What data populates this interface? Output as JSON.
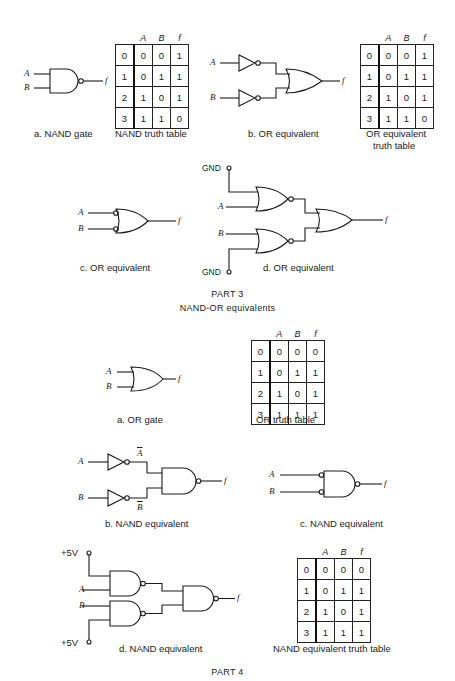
{
  "part3": {
    "title": "PART 3",
    "subtitle": "NAND-OR equivalents",
    "a": {
      "caption": "a. NAND gate",
      "in_a": "A",
      "in_b": "B",
      "out": "f"
    },
    "nand_table": {
      "caption": "NAND truth table",
      "headers": [
        "",
        "A",
        "B",
        "f"
      ],
      "rows": [
        [
          "0",
          "0",
          "0",
          "1"
        ],
        [
          "1",
          "0",
          "1",
          "1"
        ],
        [
          "2",
          "1",
          "0",
          "1"
        ],
        [
          "3",
          "1",
          "1",
          "0"
        ]
      ]
    },
    "b": {
      "caption": "b. OR equivalent",
      "in_a": "A",
      "in_b": "B",
      "out": "f"
    },
    "or_eq_table": {
      "caption_line1": "OR equivalent",
      "caption_line2": "truth table",
      "headers": [
        "",
        "A",
        "B",
        "f"
      ],
      "rows": [
        [
          "0",
          "0",
          "0",
          "1"
        ],
        [
          "1",
          "0",
          "1",
          "1"
        ],
        [
          "2",
          "1",
          "0",
          "1"
        ],
        [
          "3",
          "1",
          "1",
          "0"
        ]
      ]
    },
    "c": {
      "caption": "c. OR equivalent",
      "in_a": "A",
      "in_b": "B",
      "out": "f"
    },
    "d": {
      "caption": "d. OR equivalent",
      "gnd_top": "GND",
      "gnd_bottom": "GND",
      "in_a": "A",
      "in_b": "B",
      "out": "f"
    }
  },
  "part4": {
    "title": "PART 4",
    "a": {
      "caption": "a.  OR gate",
      "in_a": "A",
      "in_b": "B",
      "out": "f"
    },
    "or_table": {
      "caption": "OR  truth table",
      "headers": [
        "",
        "A",
        "B",
        "f"
      ],
      "rows": [
        [
          "0",
          "0",
          "0",
          "0"
        ],
        [
          "1",
          "0",
          "1",
          "1"
        ],
        [
          "2",
          "1",
          "0",
          "1"
        ],
        [
          "3",
          "1",
          "1",
          "1"
        ]
      ]
    },
    "b": {
      "caption": "b.  NAND equivalent",
      "in_a": "A",
      "in_b": "B",
      "a_bar": "A",
      "b_bar": "B",
      "out": "f"
    },
    "c": {
      "caption": "c.  NAND  equivalent",
      "in_a": "A",
      "in_b": "B",
      "out": "f"
    },
    "d": {
      "caption": "d.  NAND  equivalent",
      "vcc_top": "+5V",
      "vcc_bottom": "+5V",
      "in_a": "A",
      "in_b": "B",
      "out": "f"
    },
    "nand_eq_table": {
      "caption": "NAND  equivalent truth table",
      "headers": [
        "",
        "A",
        "B",
        "f"
      ],
      "rows": [
        [
          "0",
          "0",
          "0",
          "0"
        ],
        [
          "1",
          "0",
          "1",
          "1"
        ],
        [
          "2",
          "1",
          "0",
          "1"
        ],
        [
          "3",
          "1",
          "1",
          "1"
        ]
      ]
    }
  }
}
